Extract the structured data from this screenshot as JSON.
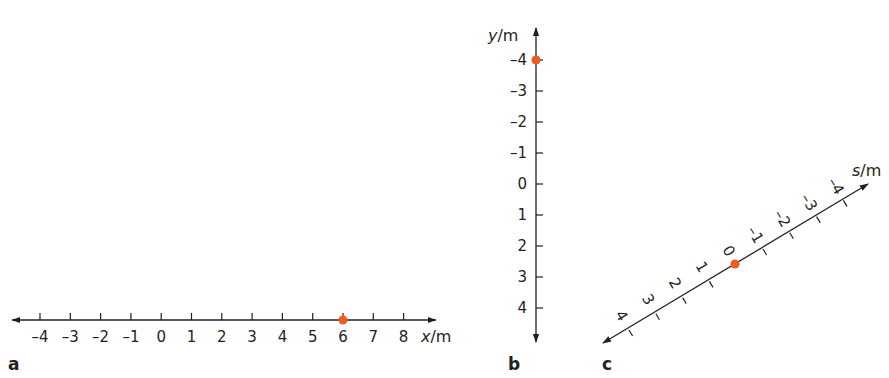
{
  "colors": {
    "axis": "#231f20",
    "point": "#f15a22"
  },
  "panels": [
    {
      "label": "a",
      "axis_var": "x",
      "axis_unit": "/m",
      "orientation": "horizontal",
      "ticks": [
        "–4",
        "–3",
        "–2",
        "–1",
        "0",
        "1",
        "2",
        "3",
        "4",
        "5",
        "6",
        "7",
        "8"
      ],
      "point_value": "6"
    },
    {
      "label": "b",
      "axis_var": "y",
      "axis_unit": "/m",
      "orientation": "vertical (positive downward)",
      "ticks": [
        "–4",
        "–3",
        "–2",
        "–1",
        "0",
        "1",
        "2",
        "3",
        "4"
      ],
      "point_value": "–4"
    },
    {
      "label": "c",
      "axis_var": "s",
      "axis_unit": "/m",
      "orientation": "diagonal (positive toward lower-left)",
      "ticks": [
        "4",
        "3",
        "2",
        "1",
        "0",
        "–1",
        "–2",
        "–3",
        "–4"
      ],
      "point_value": "0"
    }
  ]
}
